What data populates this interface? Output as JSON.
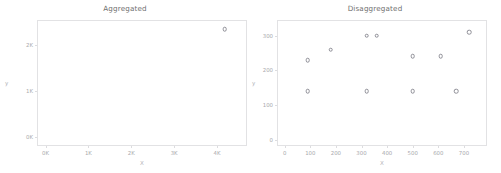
{
  "chart_data": [
    {
      "type": "scatter",
      "title": "Aggregated",
      "xlabel": "X",
      "ylabel": "y",
      "xlim": [
        -200,
        4700
      ],
      "ylim": [
        -200,
        2550
      ],
      "xticks": [
        0,
        1000,
        2000,
        3000,
        4000
      ],
      "xticklabels": [
        "0K",
        "1K",
        "2K",
        "3K",
        "4K"
      ],
      "yticks": [
        0,
        1000,
        2000
      ],
      "yticklabels": [
        "0K",
        "1K",
        "2K"
      ],
      "grid": false,
      "legend": "none",
      "marker": "open-circle",
      "points": [
        {
          "x": 4180,
          "y": 2350
        }
      ]
    },
    {
      "type": "scatter",
      "title": "Disaggregated",
      "xlabel": "X",
      "ylabel": "y",
      "xlim": [
        -30,
        790
      ],
      "ylim": [
        -18,
        345
      ],
      "xticks": [
        0,
        100,
        200,
        300,
        400,
        500,
        600,
        700
      ],
      "xticklabels": [
        "0",
        "100",
        "200",
        "300",
        "400",
        "500",
        "600",
        "700"
      ],
      "yticks": [
        0,
        100,
        200,
        300
      ],
      "yticklabels": [
        "0",
        "100",
        "200",
        "300"
      ],
      "grid": false,
      "legend": "none",
      "marker": "open-circle",
      "points": [
        {
          "x": 90,
          "y": 230
        },
        {
          "x": 180,
          "y": 260
        },
        {
          "x": 320,
          "y": 300
        },
        {
          "x": 360,
          "y": 300
        },
        {
          "x": 500,
          "y": 240
        },
        {
          "x": 610,
          "y": 240
        },
        {
          "x": 720,
          "y": 310
        },
        {
          "x": 90,
          "y": 140
        },
        {
          "x": 320,
          "y": 140
        },
        {
          "x": 500,
          "y": 140
        },
        {
          "x": 670,
          "y": 140
        }
      ]
    }
  ],
  "style": {
    "frame_color": "#e2e2e4",
    "tick_color": "#a9a9ad",
    "marker_color": "#8e8e96",
    "title_color": "#6f6f6f",
    "background": "#ffffff"
  }
}
